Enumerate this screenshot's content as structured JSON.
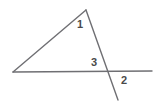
{
  "figure": {
    "kind": "geometry-diagram",
    "background_color": "#ffffff",
    "line_color": "#6f6f73",
    "label_color": "#4a4a4a",
    "line_width": 1.4,
    "canvas": {
      "width": 159,
      "height": 108
    }
  },
  "points": {
    "apex": {
      "name": "apex",
      "x": 86,
      "y": 10
    },
    "left_vertex": {
      "name": "left-vertex",
      "x": 13,
      "y": 72
    },
    "intersection": {
      "name": "intersection",
      "x": 107,
      "y": 71
    },
    "base_right_end": {
      "name": "base-right-end",
      "x": 152,
      "y": 71
    },
    "transversal_end": {
      "name": "transversal-end",
      "x": 118,
      "y": 100
    }
  },
  "segments": [
    {
      "name": "left-slanted-side",
      "from": "left_vertex",
      "to": "apex"
    },
    {
      "name": "right-slanted-side",
      "from": "apex",
      "to": "transversal_end"
    },
    {
      "name": "horizontal-base",
      "from": "left_vertex",
      "to": "base_right_end"
    }
  ],
  "labels": [
    {
      "name": "angle-label-1",
      "text": "1",
      "x": 80,
      "y": 25
    },
    {
      "name": "angle-label-3",
      "text": "3",
      "x": 94,
      "y": 63
    },
    {
      "name": "angle-label-2",
      "text": "2",
      "x": 124,
      "y": 81
    }
  ]
}
